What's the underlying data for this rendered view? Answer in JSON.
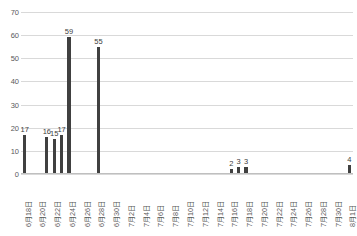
{
  "chart_data": {
    "type": "bar",
    "title": "",
    "subtitle": "",
    "xlabel": "",
    "ylabel": "",
    "ylim": [
      0,
      70
    ],
    "ytick_step": 10,
    "yticks": [
      0,
      10,
      20,
      30,
      40,
      50,
      60,
      70
    ],
    "grid": true,
    "legend": "none",
    "bar_color": "#404040",
    "gridline_color": "#d9d9d9",
    "axis_color": "#bfbfbf",
    "text_color": "#595959",
    "tick_label_rotation": -90,
    "categories": [
      "6月18日",
      "6月19日",
      "6月20日",
      "6月21日",
      "6月22日",
      "6月23日",
      "6月24日",
      "6月25日",
      "6月26日",
      "6月27日",
      "6月28日",
      "6月29日",
      "6月30日",
      "7月1日",
      "7月2日",
      "7月3日",
      "7月4日",
      "7月5日",
      "7月6日",
      "7月7日",
      "7月8日",
      "7月9日",
      "7月10日",
      "7月11日",
      "7月12日",
      "7月13日",
      "7月14日",
      "7月15日",
      "7月16日",
      "7月17日",
      "7月18日",
      "7月19日",
      "7月20日",
      "7月21日",
      "7月22日",
      "7月23日",
      "7月24日",
      "7月25日",
      "7月26日",
      "7月27日",
      "7月28日",
      "7月29日",
      "7月30日",
      "7月31日",
      "8月1日"
    ],
    "displayed_tick_labels": [
      "6月18日",
      "6月20日",
      "6月22日",
      "6月24日",
      "6月26日",
      "6月28日",
      "6月30日",
      "7月2日",
      "7月4日",
      "7月6日",
      "7月8日",
      "7月10日",
      "7月12日",
      "7月14日",
      "7月16日",
      "7月18日",
      "7月20日",
      "7月22日",
      "7月24日",
      "7月26日",
      "7月28日",
      "7月30日",
      "8月1日"
    ],
    "values": [
      17,
      0,
      0,
      16,
      15,
      17,
      59,
      0,
      0,
      0,
      55,
      0,
      0,
      0,
      0,
      0,
      0,
      0,
      0,
      0,
      0,
      0,
      0,
      0,
      0,
      0,
      0,
      0,
      2,
      3,
      3,
      0,
      0,
      0,
      0,
      0,
      0,
      0,
      0,
      0,
      0,
      0,
      0,
      0,
      4
    ],
    "data_labels": [
      {
        "category": "6月18日",
        "value": 17
      },
      {
        "category": "6月21日",
        "value": 16
      },
      {
        "category": "6月22日",
        "value": 15
      },
      {
        "category": "6月23日",
        "value": 17
      },
      {
        "category": "6月24日",
        "value": 59
      },
      {
        "category": "6月28日",
        "value": 55
      },
      {
        "category": "7月16日",
        "value": 2
      },
      {
        "category": "7月17日",
        "value": 3
      },
      {
        "category": "7月18日",
        "value": 3
      },
      {
        "category": "8月1日",
        "value": 4
      }
    ]
  }
}
